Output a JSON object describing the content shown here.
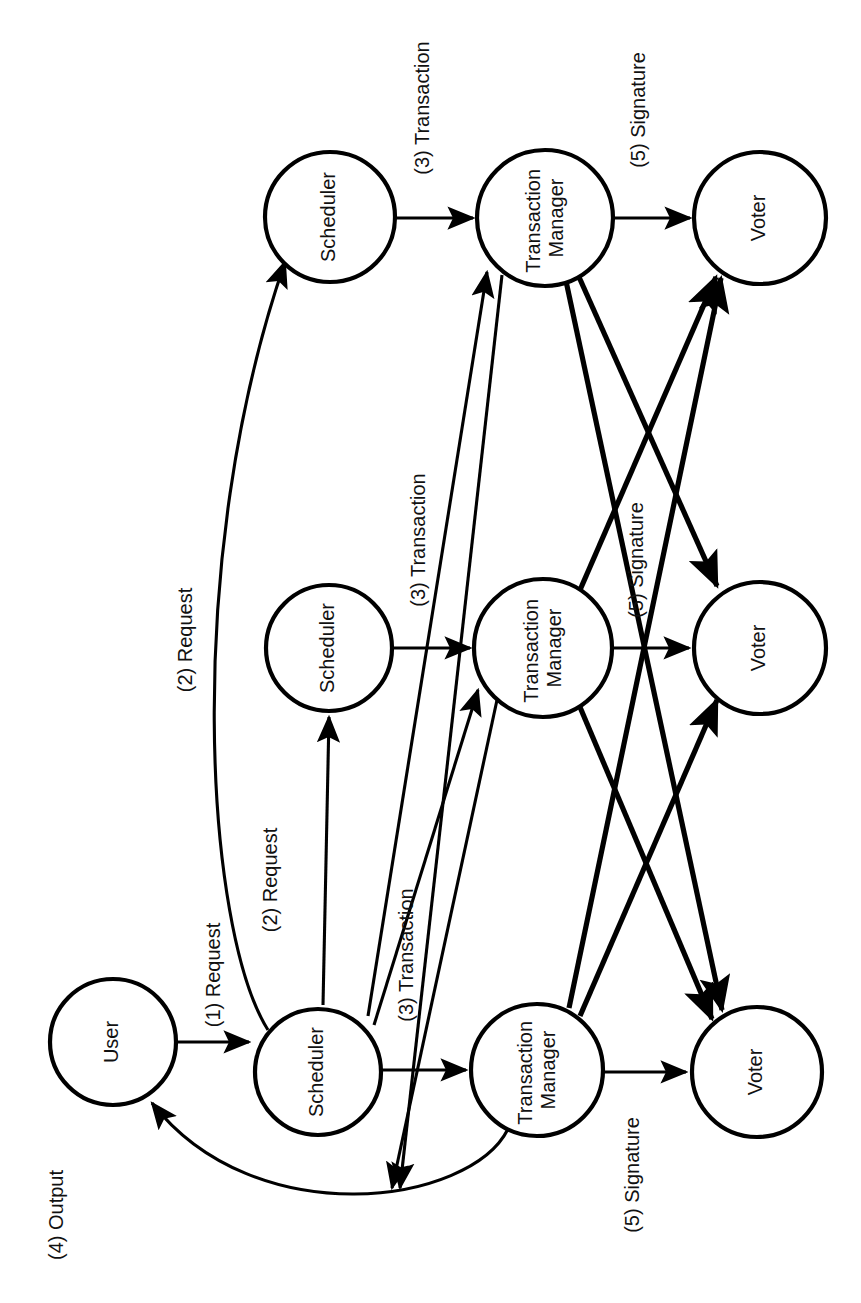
{
  "diagram": {
    "orientation": "rotated-90-ccw",
    "background_color": "#ffffff",
    "stroke_color": "#000000",
    "nodes": [
      {
        "id": "user",
        "label": "User",
        "cx": 113,
        "cy": 1042,
        "r": 63
      },
      {
        "id": "sched1",
        "label": "Scheduler",
        "cx": 318,
        "cy": 1072,
        "r": 63
      },
      {
        "id": "sched2",
        "label": "Scheduler",
        "cx": 329,
        "cy": 648,
        "r": 63
      },
      {
        "id": "sched3",
        "label": "Scheduler",
        "cx": 330,
        "cy": 217,
        "r": 65
      },
      {
        "id": "tm1",
        "label": "Transaction\nManager",
        "cx": 537,
        "cy": 1070,
        "r": 66
      },
      {
        "id": "tm2",
        "label": "Transaction\nManager",
        "cx": 543,
        "cy": 648,
        "r": 69
      },
      {
        "id": "tm3",
        "label": "Transaction\nManager",
        "cx": 545,
        "cy": 218,
        "r": 68
      },
      {
        "id": "voter1",
        "label": "Voter",
        "cx": 757,
        "cy": 1072,
        "r": 65
      },
      {
        "id": "voter2",
        "label": "Voter",
        "cx": 760,
        "cy": 648,
        "r": 66
      },
      {
        "id": "voter3",
        "label": "Voter",
        "cx": 760,
        "cy": 218,
        "r": 66
      }
    ],
    "edge_labels": [
      {
        "id": "lbl-1-request",
        "text": "(1) Request",
        "x": 215,
        "y": 975
      },
      {
        "id": "lbl-2-request-a",
        "text": "(2) Request",
        "x": 310,
        "y": 885
      },
      {
        "id": "lbl-2-request-b",
        "text": "(2) Request",
        "x": 187,
        "y": 640
      },
      {
        "id": "lbl-3-transaction-a",
        "text": "(3) Transaction",
        "x": 420,
        "y": 955
      },
      {
        "id": "lbl-3-transaction-b",
        "text": "(3) Transaction",
        "x": 432,
        "y": 540
      },
      {
        "id": "lbl-3-transaction-c",
        "text": "(3) Transaction",
        "x": 434,
        "y": 108
      },
      {
        "id": "lbl-4-output",
        "text": "(4) Output",
        "x": 58,
        "y": 1215
      },
      {
        "id": "lbl-5-signature-a",
        "text": "(5) Signature",
        "x": 648,
        "y": 1175
      },
      {
        "id": "lbl-5-signature-b",
        "text": "(5) Signature",
        "x": 645,
        "y": 560
      },
      {
        "id": "lbl-5-signature-c",
        "text": "(5) Signature",
        "x": 648,
        "y": 110
      }
    ],
    "flows": [
      {
        "step": "(1)",
        "label": "Request",
        "from": "User",
        "to": "Scheduler"
      },
      {
        "step": "(2)",
        "label": "Request",
        "from": "Scheduler",
        "to": "Scheduler (replicas)"
      },
      {
        "step": "(3)",
        "label": "Transaction",
        "from": "Scheduler",
        "to": "Transaction Manager (all replicas)"
      },
      {
        "step": "(4)",
        "label": "Output",
        "from": "Transaction Manager",
        "to": "User"
      },
      {
        "step": "(5)",
        "label": "Signature",
        "from": "Transaction Manager",
        "to": "Voter (all replicas)"
      }
    ]
  }
}
